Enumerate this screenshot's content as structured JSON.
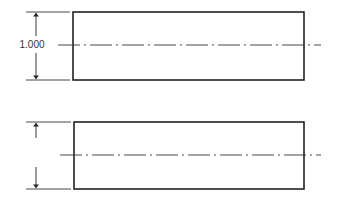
{
  "drawing": {
    "background": "#ffffff",
    "line_color": "#222222",
    "views": [
      {
        "name": "top-view",
        "rect": {
          "x": 73,
          "y": 12,
          "w": 231,
          "h": 68
        },
        "centerline_y": 45,
        "centerline_x1": 58,
        "centerline_x2": 321,
        "dimension": {
          "label": "1.000",
          "x": 36,
          "ext_x1": 26,
          "ext_x2": 70
        }
      },
      {
        "name": "bottom-view",
        "rect": {
          "x": 74,
          "y": 122,
          "w": 230,
          "h": 67
        },
        "centerline_y": 155,
        "centerline_x1": 60,
        "centerline_x2": 321,
        "dimension": {
          "label": "",
          "x": 36,
          "ext_x1": 26,
          "ext_x2": 70
        }
      }
    ]
  }
}
